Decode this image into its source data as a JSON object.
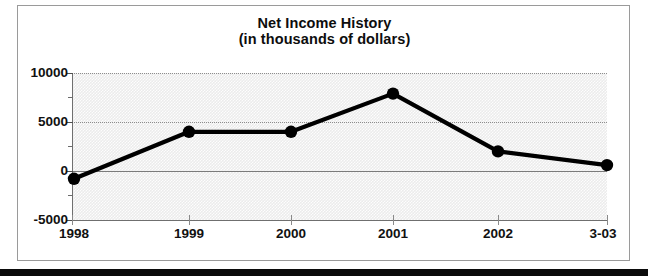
{
  "figure": {
    "title_line1": "Net Income History",
    "title_line2": "(in thousands of dollars)",
    "frame_border_color": "#9a9a9a",
    "plot_background_color": "#ececec",
    "series_color": "#000000"
  },
  "chart_data": {
    "type": "line",
    "title": "Net Income History (in thousands of dollars)",
    "xlabel": "",
    "ylabel": "",
    "categories": [
      "1998",
      "1999",
      "2000",
      "2001",
      "2002",
      "3-03"
    ],
    "values": [
      -800,
      4000,
      4000,
      7900,
      2000,
      600
    ],
    "series": [
      {
        "name": "Net Income",
        "values": [
          -800,
          4000,
          4000,
          7900,
          2000,
          600
        ]
      }
    ],
    "ylim": [
      -5000,
      10000
    ],
    "ytick_labels": [
      "10000",
      "5000",
      "0",
      "-5000"
    ],
    "ytick_values": [
      10000,
      5000,
      0,
      -5000
    ],
    "yminor_tick_values": [
      7500,
      2500,
      -2500
    ],
    "grid": true,
    "legend": false,
    "markers": "filled-circle"
  }
}
